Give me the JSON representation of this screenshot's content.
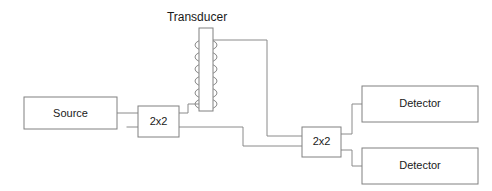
{
  "diagram": {
    "kind": "fiber-optic-interferometer-schematic",
    "background_color": "#ffffff",
    "line_color": "#8a8a8a",
    "text_color": "#1a1a1a",
    "labels": {
      "transducer": "Transducer",
      "source": "Source",
      "coupler_left": "2x2",
      "coupler_right": "2x2",
      "detector_top": "Detector",
      "detector_bottom": "Detector"
    },
    "blocks": [
      {
        "name": "source",
        "label": "Source",
        "x": 24,
        "y": 97,
        "w": 93,
        "h": 32
      },
      {
        "name": "coupler-left",
        "label": "2x2",
        "x": 138,
        "y": 106,
        "w": 41,
        "h": 31
      },
      {
        "name": "transducer-body",
        "label": "",
        "x": 199,
        "y": 28,
        "w": 14,
        "h": 83
      },
      {
        "name": "coupler-right",
        "label": "2x2",
        "x": 302,
        "y": 127,
        "w": 39,
        "h": 30
      },
      {
        "name": "detector-top",
        "label": "Detector",
        "x": 362,
        "y": 86,
        "w": 116,
        "h": 36
      },
      {
        "name": "detector-bottom",
        "label": "Detector",
        "x": 362,
        "y": 148,
        "w": 116,
        "h": 36
      }
    ],
    "coil": {
      "loop_count": 6,
      "first_loop_center_y": 45,
      "loop_spacing": 12,
      "loop_width": 22,
      "loop_height": 11
    },
    "wires": [
      {
        "name": "source-to-coupler-left",
        "points": "117,113 138,113"
      },
      {
        "name": "coupler-left-lower-left-stub",
        "points": "127,127 138,127"
      },
      {
        "name": "coil-bottom-to-coupler-left",
        "points": "179,113 188,113 188,104 199,104"
      },
      {
        "name": "coil-top-to-coupler-right",
        "points": "213,40 267,40 267,136 302,136"
      },
      {
        "name": "coupler-left-lower-to-coupler-right",
        "points": "179,127 243,127 243,146 302,146"
      },
      {
        "name": "coupler-right-to-detector-top",
        "points": "341,134 352,134 352,104 362,104"
      },
      {
        "name": "coupler-right-to-detector-bottom",
        "points": "341,150 352,150 352,166 362,166"
      }
    ],
    "title_position": {
      "x": 197,
      "y": 18
    }
  }
}
